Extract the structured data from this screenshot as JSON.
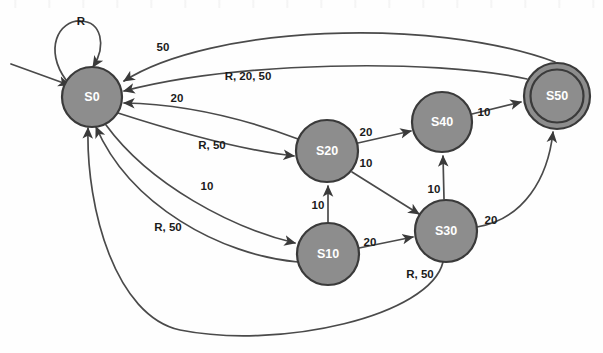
{
  "diagram": {
    "type": "state-machine",
    "colors": {
      "node_fill": "#8d8d8d",
      "node_stroke": "#3a3a3a",
      "edge_stroke": "#4a4a4a",
      "node_text": "#ffffff",
      "label_text": "#1b1b1b",
      "background": "#fefefe"
    },
    "nodes": [
      {
        "id": "S0",
        "label": "S0",
        "cx": 92,
        "cy": 97,
        "r": 30,
        "accepting": false
      },
      {
        "id": "S10",
        "label": "S10",
        "cx": 328,
        "cy": 254,
        "r": 31,
        "accepting": false
      },
      {
        "id": "S20",
        "label": "S20",
        "cx": 327,
        "cy": 151,
        "r": 31,
        "accepting": false
      },
      {
        "id": "S30",
        "label": "S30",
        "cx": 446,
        "cy": 231,
        "r": 31,
        "accepting": false
      },
      {
        "id": "S40",
        "label": "S40",
        "cx": 442,
        "cy": 122,
        "r": 30,
        "accepting": false
      },
      {
        "id": "S50",
        "label": "S50",
        "cx": 557,
        "cy": 96,
        "r": 33,
        "accepting": true
      }
    ],
    "start_state": "S0",
    "accepting_states": [
      "S50"
    ],
    "edges": [
      {
        "from": "start",
        "to": "S0",
        "label": "",
        "label_x": 0,
        "label_y": 0
      },
      {
        "from": "S0",
        "to": "S0",
        "label": "R",
        "label_x": 81,
        "label_y": 22
      },
      {
        "from": "S50",
        "to": "S0",
        "label": "50",
        "label_x": 163,
        "label_y": 48
      },
      {
        "from": "S50",
        "to": "S0",
        "label": "R, 20, 50",
        "label_x": 248,
        "label_y": 77
      },
      {
        "from": "S20",
        "to": "S0",
        "label": "20",
        "label_x": 177,
        "label_y": 99
      },
      {
        "from": "S0",
        "to": "S20",
        "label": "R, 50",
        "label_x": 212,
        "label_y": 146
      },
      {
        "from": "S0",
        "to": "S10",
        "label": "10",
        "label_x": 207,
        "label_y": 187
      },
      {
        "from": "S10",
        "to": "S0",
        "label": "R, 50",
        "label_x": 168,
        "label_y": 228
      },
      {
        "from": "S30",
        "to": "S0",
        "label": "R, 50",
        "label_x": 420,
        "label_y": 275
      },
      {
        "from": "S10",
        "to": "S20",
        "label": "10",
        "label_x": 318,
        "label_y": 206
      },
      {
        "from": "S10",
        "to": "S30",
        "label": "20",
        "label_x": 370,
        "label_y": 243
      },
      {
        "from": "S20",
        "to": "S40",
        "label": "20",
        "label_x": 366,
        "label_y": 133
      },
      {
        "from": "S20",
        "to": "S30",
        "label": "10",
        "label_x": 366,
        "label_y": 164
      },
      {
        "from": "S30",
        "to": "S40",
        "label": "10",
        "label_x": 434,
        "label_y": 190
      },
      {
        "from": "S40",
        "to": "S50",
        "label": "10",
        "label_x": 484,
        "label_y": 113
      },
      {
        "from": "S30",
        "to": "S50",
        "label": "20",
        "label_x": 491,
        "label_y": 221
      }
    ]
  }
}
